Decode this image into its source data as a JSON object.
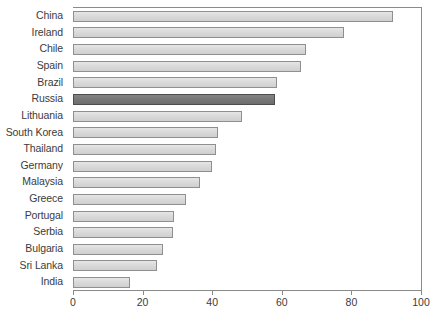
{
  "chart_data": {
    "type": "bar",
    "orientation": "horizontal",
    "title": "",
    "subtitle": "",
    "xlabel": "",
    "ylabel": "",
    "xlim": [
      0,
      100
    ],
    "xticks": [
      0,
      20,
      40,
      60,
      80,
      100
    ],
    "xtick_labels": [
      "0",
      "20",
      "40",
      "60",
      "80",
      "100"
    ],
    "grid": false,
    "legend": "none",
    "highlight_category": "Russia",
    "colors": {
      "bar_fill": "#dadada",
      "bar_border": "#8f8f8f",
      "highlight_fill": "#787878",
      "highlight_border": "#4d4d4d",
      "axis": "#8a8a8a",
      "text": "#3b3b3b",
      "background": "#ffffff"
    },
    "categories": [
      "China",
      "Ireland",
      "Chile",
      "Spain",
      "Brazil",
      "Russia",
      "Lithuania",
      "South Korea",
      "Thailand",
      "Germany",
      "Malaysia",
      "Greece",
      "Portugal",
      "Serbia",
      "Bulgaria",
      "Sri Lanka",
      "India"
    ],
    "values": [
      92,
      78,
      67,
      65.5,
      58.5,
      58,
      48.5,
      41.7,
      41,
      40,
      36.5,
      32.5,
      29,
      28.7,
      26,
      24,
      16.5
    ]
  }
}
